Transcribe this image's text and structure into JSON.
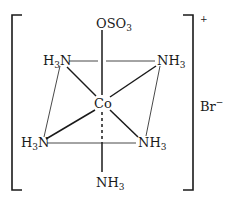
{
  "diagram": {
    "type": "coordination-complex",
    "central_atom": "Co",
    "ligands": {
      "axial_top": {
        "base": "OSO",
        "sub": "3"
      },
      "equatorial_top_left": {
        "pre": "H",
        "sub": "3",
        "post": "N"
      },
      "equatorial_top_right": {
        "base": "NH",
        "sub": "3"
      },
      "equatorial_bottom_left": {
        "pre": "H",
        "sub": "3",
        "post": "N"
      },
      "equatorial_bottom_right": {
        "base": "NH",
        "sub": "3"
      },
      "axial_bottom": {
        "base": "NH",
        "sub": "3"
      }
    },
    "complex_charge": "+",
    "counter_ion": {
      "base": "Br",
      "sup": "−"
    },
    "colors": {
      "ink": "#1a1a1a",
      "background": "#ffffff"
    }
  }
}
